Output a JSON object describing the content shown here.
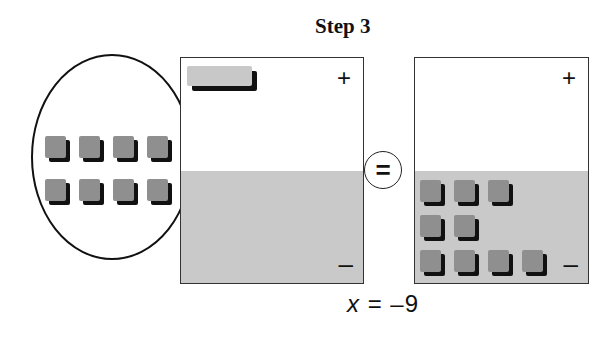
{
  "title": "Step 3",
  "left_mat": {
    "positive_sign": "+",
    "negative_sign": "–",
    "positive_tiles": [
      {
        "type": "x-tile",
        "count": 1
      }
    ],
    "negative_tiles": []
  },
  "removed_group": {
    "description": "8 negative unit tiles moved out of the left mat",
    "rows": [
      4,
      4
    ],
    "arrows": [
      "⇐",
      "⇐"
    ]
  },
  "equals_symbol": "=",
  "right_mat": {
    "positive_sign": "+",
    "negative_sign": "–",
    "positive_tiles": [],
    "negative_tile_rows": [
      3,
      2,
      4
    ],
    "negative_unit_count": 9
  },
  "solution": {
    "variable": "x",
    "equals": "=",
    "value": "–9"
  },
  "colors": {
    "mat_negative_fill": "#c9c9c9",
    "unit_tile": "#8f8f8f",
    "x_tile": "#c8c8c8",
    "tile_shadow": "#111111"
  }
}
